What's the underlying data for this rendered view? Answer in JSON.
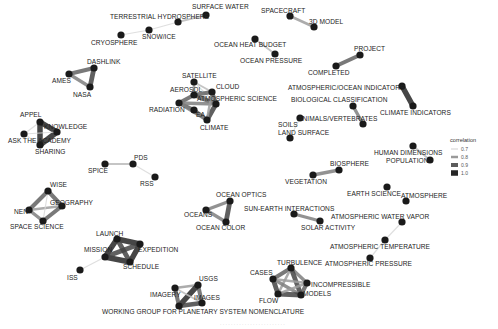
{
  "diagram": {
    "type": "network",
    "legend": {
      "title": "correlation",
      "entries": [
        {
          "label": "0.7",
          "color": "#d9d9d9",
          "width": 1.2
        },
        {
          "label": "0.8",
          "color": "#9a9a9a",
          "width": 2.5
        },
        {
          "label": "0.9",
          "color": "#5c5c5c",
          "width": 4
        },
        {
          "label": "1.0",
          "color": "#262626",
          "width": 5.5
        }
      ]
    },
    "caption": "· · · · · · · · · · · · · · · · · · · · · · · ·",
    "nodes": [
      {
        "id": "surface_water",
        "label": "SURFACE WATER",
        "x": 206,
        "y": 15,
        "lx": 192,
        "ly": 9
      },
      {
        "id": "terrestrial_hydrosphere",
        "label": "TERRESTRIAL HYDROSPHERE",
        "x": 178,
        "y": 22,
        "lx": 110,
        "ly": 19
      },
      {
        "id": "snow_ice",
        "label": "SNOW/ICE",
        "x": 149,
        "y": 30,
        "lx": 142,
        "ly": 39
      },
      {
        "id": "cryosphere",
        "label": "CRYOSPHERE",
        "x": 121,
        "y": 35,
        "lx": 91,
        "ly": 45
      },
      {
        "id": "spacecraft",
        "label": "SPACECRAFT",
        "x": 290,
        "y": 16,
        "lx": 261,
        "ly": 13
      },
      {
        "id": "3d_model",
        "label": "3D MODEL",
        "x": 314,
        "y": 27,
        "lx": 309,
        "ly": 24
      },
      {
        "id": "ocean_heat_budget",
        "label": "OCEAN HEAT BUDGET",
        "x": 255,
        "y": 39,
        "lx": 214,
        "ly": 47
      },
      {
        "id": "ocean_pressure",
        "label": "OCEAN PRESSURE",
        "x": 275,
        "y": 54,
        "lx": 240,
        "ly": 63
      },
      {
        "id": "project",
        "label": "PROJECT",
        "x": 360,
        "y": 55,
        "lx": 354,
        "ly": 51
      },
      {
        "id": "completed",
        "label": "COMPLETED",
        "x": 336,
        "y": 66,
        "lx": 308,
        "ly": 75
      },
      {
        "id": "dashlink",
        "label": "DASHLINK",
        "x": 94,
        "y": 68,
        "lx": 87,
        "ly": 64
      },
      {
        "id": "ames",
        "label": "AMES",
        "x": 69,
        "y": 74,
        "lx": 52,
        "ly": 83
      },
      {
        "id": "nasa",
        "label": "NASA",
        "x": 90,
        "y": 87,
        "lx": 73,
        "ly": 97
      },
      {
        "id": "atmospheric_ocean_indicators",
        "label": "ATMOSPHERIC/OCEAN INDICATORS",
        "x": 402,
        "y": 86,
        "lx": 288,
        "ly": 90
      },
      {
        "id": "climate_indicators",
        "label": "CLIMATE INDICATORS",
        "x": 413,
        "y": 106,
        "lx": 380,
        "ly": 115
      },
      {
        "id": "satellite",
        "label": "SATELLITE",
        "x": 194,
        "y": 82,
        "lx": 182,
        "ly": 78
      },
      {
        "id": "aerosol",
        "label": "AEROSOL",
        "x": 194,
        "y": 95,
        "lx": 170,
        "ly": 92
      },
      {
        "id": "cloud",
        "label": "CLOUD",
        "x": 212,
        "y": 92,
        "lx": 216,
        "ly": 89
      },
      {
        "id": "atmospheric_science",
        "label": "ATMOSPHERIC SCIENCE",
        "x": 216,
        "y": 104,
        "lx": 197,
        "ly": 101
      },
      {
        "id": "radiation",
        "label": "RADIATION",
        "x": 179,
        "y": 103,
        "lx": 149,
        "ly": 112
      },
      {
        "id": "ea",
        "label": "EA",
        "x": 194,
        "y": 110,
        "lx": 196,
        "ly": 117
      },
      {
        "id": "climate",
        "label": "CLIMATE",
        "x": 207,
        "y": 120,
        "lx": 200,
        "ly": 130
      },
      {
        "id": "biological_classification",
        "label": "BIOLOGICAL CLASSIFICATION",
        "x": 353,
        "y": 106,
        "lx": 291,
        "ly": 102
      },
      {
        "id": "animals_vertebrates",
        "label": "ANIMALS/VERTEBRATES",
        "x": 363,
        "y": 124,
        "lx": 298,
        "ly": 121
      },
      {
        "id": "soils",
        "label": "SOILS",
        "x": 300,
        "y": 118,
        "lx": 278,
        "ly": 127
      },
      {
        "id": "land_surface",
        "label": "LAND SURFACE",
        "x": 290,
        "y": 138,
        "lx": 278,
        "ly": 135
      },
      {
        "id": "appel",
        "label": "APPEL",
        "x": 40,
        "y": 122,
        "lx": 20,
        "ly": 117
      },
      {
        "id": "knowledge",
        "label": "KNOWLEDGE",
        "x": 57,
        "y": 132,
        "lx": 44,
        "ly": 129
      },
      {
        "id": "ask_the_academy",
        "label": "ASK THE ACADEMY",
        "x": 24,
        "y": 134,
        "lx": 8,
        "ly": 143
      },
      {
        "id": "sharing",
        "label": "SHARING",
        "x": 40,
        "y": 145,
        "lx": 35,
        "ly": 154
      },
      {
        "id": "human_dimensions",
        "label": "HUMAN DIMENSIONS",
        "x": 413,
        "y": 146,
        "lx": 374,
        "ly": 155
      },
      {
        "id": "population",
        "label": "POPULATION",
        "x": 430,
        "y": 160,
        "lx": 386,
        "ly": 163
      },
      {
        "id": "pds",
        "label": "PDS",
        "x": 133,
        "y": 164,
        "lx": 134,
        "ly": 160
      },
      {
        "id": "spice",
        "label": "SPICE",
        "x": 105,
        "y": 164,
        "lx": 88,
        "ly": 173
      },
      {
        "id": "rss",
        "label": "RSS",
        "x": 155,
        "y": 177,
        "lx": 140,
        "ly": 186
      },
      {
        "id": "biosphere",
        "label": "BIOSPHERE",
        "x": 339,
        "y": 170,
        "lx": 330,
        "ly": 166
      },
      {
        "id": "vegetation",
        "label": "VEGETATION",
        "x": 313,
        "y": 175,
        "lx": 285,
        "ly": 184
      },
      {
        "id": "earth_science",
        "label": "EARTH SCIENCE",
        "x": 387,
        "y": 187,
        "lx": 347,
        "ly": 196
      },
      {
        "id": "atmosphere",
        "label": "ATMOSPHERE",
        "x": 406,
        "y": 201,
        "lx": 401,
        "ly": 198
      },
      {
        "id": "wise",
        "label": "WISE",
        "x": 48,
        "y": 191,
        "lx": 50,
        "ly": 187
      },
      {
        "id": "geography",
        "label": "GEOGRAPHY",
        "x": 62,
        "y": 206,
        "lx": 50,
        "ly": 205
      },
      {
        "id": "nen",
        "label": "NEN",
        "x": 29,
        "y": 210,
        "lx": 14,
        "ly": 214
      },
      {
        "id": "space_science",
        "label": "SPACE SCIENCE",
        "x": 43,
        "y": 221,
        "lx": 10,
        "ly": 229
      },
      {
        "id": "ocean_optics",
        "label": "OCEAN OPTICS",
        "x": 230,
        "y": 201,
        "lx": 216,
        "ly": 197
      },
      {
        "id": "oceans",
        "label": "OCEANS",
        "x": 206,
        "y": 210,
        "lx": 184,
        "ly": 217
      },
      {
        "id": "ocean_color",
        "label": "OCEAN COLOR",
        "x": 226,
        "y": 222,
        "lx": 196,
        "ly": 230
      },
      {
        "id": "sun_earth_interactions",
        "label": "SUN-EARTH INTERACTIONS",
        "x": 294,
        "y": 214,
        "lx": 244,
        "ly": 211
      },
      {
        "id": "solar_activity",
        "label": "SOLAR ACTIVITY",
        "x": 320,
        "y": 221,
        "lx": 301,
        "ly": 230
      },
      {
        "id": "atmospheric_water_vapor",
        "label": "ATMOSPHERIC WATER VAPOR",
        "x": 402,
        "y": 222,
        "lx": 331,
        "ly": 219
      },
      {
        "id": "launch",
        "label": "LAUNCH",
        "x": 117,
        "y": 239,
        "lx": 96,
        "ly": 236
      },
      {
        "id": "expedition",
        "label": "EXPEDITION",
        "x": 140,
        "y": 244,
        "lx": 138,
        "ly": 252
      },
      {
        "id": "mission",
        "label": "MISSION",
        "x": 105,
        "y": 257,
        "lx": 84,
        "ly": 252
      },
      {
        "id": "schedule",
        "label": "SCHEDULE",
        "x": 130,
        "y": 262,
        "lx": 123,
        "ly": 269
      },
      {
        "id": "atmospheric_temperature",
        "label": "ATMOSPHERIC TEMPERATURE",
        "x": 385,
        "y": 240,
        "lx": 330,
        "ly": 249
      },
      {
        "id": "iss",
        "label": "ISS",
        "x": 80,
        "y": 270,
        "lx": 67,
        "ly": 280
      },
      {
        "id": "atmospheric_pressure",
        "label": "ATMOSPHERIC PRESSURE",
        "x": 370,
        "y": 258,
        "lx": 325,
        "ly": 266
      },
      {
        "id": "turbulence",
        "label": "TURBULENCE",
        "x": 291,
        "y": 268,
        "lx": 277,
        "ly": 265
      },
      {
        "id": "cases",
        "label": "CASES",
        "x": 273,
        "y": 279,
        "lx": 250,
        "ly": 275
      },
      {
        "id": "incompressible",
        "label": "INCOMPRESSIBLE",
        "x": 307,
        "y": 283,
        "lx": 311,
        "ly": 287
      },
      {
        "id": "flow",
        "label": "FLOW",
        "x": 278,
        "y": 294,
        "lx": 259,
        "ly": 303
      },
      {
        "id": "models",
        "label": "MODELS",
        "x": 301,
        "y": 295,
        "lx": 303,
        "ly": 296
      },
      {
        "id": "usgs",
        "label": "USGS",
        "x": 198,
        "y": 285,
        "lx": 199,
        "ly": 281
      },
      {
        "id": "imagery",
        "label": "IMAGERY",
        "x": 175,
        "y": 288,
        "lx": 150,
        "ly": 297
      },
      {
        "id": "images",
        "label": "IMAGES",
        "x": 202,
        "y": 303,
        "lx": 194,
        "ly": 300
      },
      {
        "id": "wgpsn",
        "label": "WORKING GROUP FOR PLANETARY SYSTEM NOMENCLATURE",
        "x": 179,
        "y": 306,
        "lx": 102,
        "ly": 314
      }
    ],
    "edges": [
      {
        "s": "surface_water",
        "t": "terrestrial_hydrosphere",
        "w": 0.75
      },
      {
        "s": "terrestrial_hydrosphere",
        "t": "snow_ice",
        "w": 0.7
      },
      {
        "s": "snow_ice",
        "t": "cryosphere",
        "w": 0.7
      },
      {
        "s": "spacecraft",
        "t": "3d_model",
        "w": 0.8
      },
      {
        "s": "ocean_heat_budget",
        "t": "ocean_pressure",
        "w": 0.75
      },
      {
        "s": "project",
        "t": "completed",
        "w": 0.9
      },
      {
        "s": "dashlink",
        "t": "ames",
        "w": 0.9
      },
      {
        "s": "ames",
        "t": "nasa",
        "w": 0.85
      },
      {
        "s": "dashlink",
        "t": "nasa",
        "w": 0.95
      },
      {
        "s": "atmospheric_ocean_indicators",
        "t": "climate_indicators",
        "w": 1.0
      },
      {
        "s": "satellite",
        "t": "aerosol",
        "w": 0.8
      },
      {
        "s": "satellite",
        "t": "cloud",
        "w": 0.75
      },
      {
        "s": "satellite",
        "t": "atmospheric_science",
        "w": 0.7
      },
      {
        "s": "aerosol",
        "t": "cloud",
        "w": 0.9
      },
      {
        "s": "aerosol",
        "t": "radiation",
        "w": 0.9
      },
      {
        "s": "cloud",
        "t": "atmospheric_science",
        "w": 0.9
      },
      {
        "s": "atmospheric_science",
        "t": "climate",
        "w": 0.95
      },
      {
        "s": "radiation",
        "t": "ea",
        "w": 0.9
      },
      {
        "s": "ea",
        "t": "climate",
        "w": 0.9
      },
      {
        "s": "radiation",
        "t": "climate",
        "w": 0.85
      },
      {
        "s": "aerosol",
        "t": "atmospheric_science",
        "w": 0.9
      },
      {
        "s": "radiation",
        "t": "atmospheric_science",
        "w": 0.85
      },
      {
        "s": "cloud",
        "t": "climate",
        "w": 0.8
      },
      {
        "s": "biological_classification",
        "t": "animals_vertebrates",
        "w": 0.85
      },
      {
        "s": "soils",
        "t": "land_surface",
        "w": 0.7
      },
      {
        "s": "appel",
        "t": "knowledge",
        "w": 1.0
      },
      {
        "s": "appel",
        "t": "sharing",
        "w": 1.0
      },
      {
        "s": "knowledge",
        "t": "sharing",
        "w": 1.0
      },
      {
        "s": "ask_the_academy",
        "t": "appel",
        "w": 0.7
      },
      {
        "s": "ask_the_academy",
        "t": "knowledge",
        "w": 0.7
      },
      {
        "s": "ask_the_academy",
        "t": "sharing",
        "w": 0.7
      },
      {
        "s": "human_dimensions",
        "t": "population",
        "w": 0.75
      },
      {
        "s": "spice",
        "t": "pds",
        "w": 0.75
      },
      {
        "s": "pds",
        "t": "rss",
        "w": 0.7
      },
      {
        "s": "vegetation",
        "t": "biosphere",
        "w": 0.85
      },
      {
        "s": "wise",
        "t": "geography",
        "w": 0.9
      },
      {
        "s": "wise",
        "t": "nen",
        "w": 0.9
      },
      {
        "s": "nen",
        "t": "geography",
        "w": 0.8
      },
      {
        "s": "nen",
        "t": "space_science",
        "w": 0.85
      },
      {
        "s": "space_science",
        "t": "geography",
        "w": 0.9
      },
      {
        "s": "wise",
        "t": "space_science",
        "w": 0.7
      },
      {
        "s": "ocean_optics",
        "t": "oceans",
        "w": 0.85
      },
      {
        "s": "oceans",
        "t": "ocean_color",
        "w": 0.85
      },
      {
        "s": "ocean_optics",
        "t": "ocean_color",
        "w": 0.95
      },
      {
        "s": "sun_earth_interactions",
        "t": "solar_activity",
        "w": 0.85
      },
      {
        "s": "atmospheric_water_vapor",
        "t": "atmospheric_temperature",
        "w": 0.7
      },
      {
        "s": "atmospheric_temperature",
        "t": "atmospheric_pressure",
        "w": 0.7
      },
      {
        "s": "launch",
        "t": "expedition",
        "w": 1.0
      },
      {
        "s": "launch",
        "t": "mission",
        "w": 1.0
      },
      {
        "s": "expedition",
        "t": "schedule",
        "w": 1.0
      },
      {
        "s": "mission",
        "t": "schedule",
        "w": 1.0
      },
      {
        "s": "launch",
        "t": "schedule",
        "w": 0.95
      },
      {
        "s": "mission",
        "t": "expedition",
        "w": 0.95
      },
      {
        "s": "mission",
        "t": "iss",
        "w": 0.7
      },
      {
        "s": "turbulence",
        "t": "cases",
        "w": 0.9
      },
      {
        "s": "turbulence",
        "t": "incompressible",
        "w": 0.85
      },
      {
        "s": "turbulence",
        "t": "models",
        "w": 0.95
      },
      {
        "s": "turbulence",
        "t": "flow",
        "w": 0.8
      },
      {
        "s": "cases",
        "t": "flow",
        "w": 0.95
      },
      {
        "s": "cases",
        "t": "models",
        "w": 0.85
      },
      {
        "s": "cases",
        "t": "incompressible",
        "w": 0.8
      },
      {
        "s": "flow",
        "t": "models",
        "w": 0.95
      },
      {
        "s": "flow",
        "t": "incompressible",
        "w": 0.8
      },
      {
        "s": "incompressible",
        "t": "models",
        "w": 0.9
      },
      {
        "s": "usgs",
        "t": "imagery",
        "w": 0.8
      },
      {
        "s": "usgs",
        "t": "images",
        "w": 0.9
      },
      {
        "s": "usgs",
        "t": "wgpsn",
        "w": 1.0
      },
      {
        "s": "imagery",
        "t": "wgpsn",
        "w": 0.9
      },
      {
        "s": "imagery",
        "t": "images",
        "w": 0.75
      },
      {
        "s": "images",
        "t": "wgpsn",
        "w": 0.95
      }
    ]
  }
}
